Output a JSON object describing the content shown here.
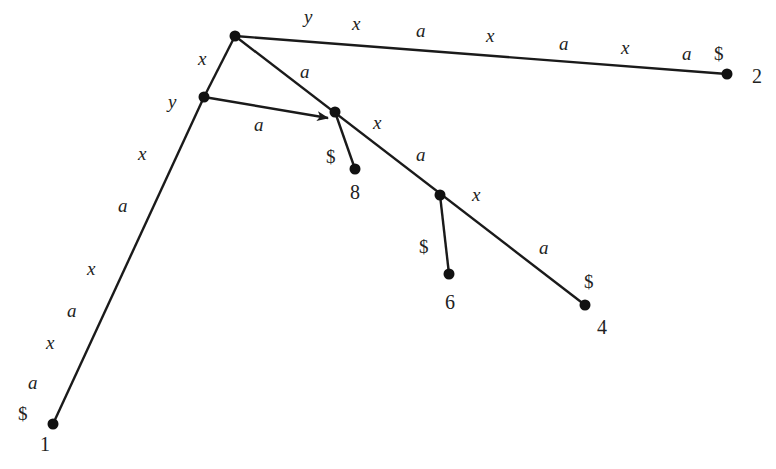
{
  "diagram": {
    "type": "suffix-tree",
    "nodes": {
      "root": {
        "x": 235,
        "y": 36
      },
      "n_x": {
        "x": 204,
        "y": 97
      },
      "n_xa": {
        "x": 335,
        "y": 112
      },
      "n_xaxa": {
        "x": 440,
        "y": 195
      },
      "leaf1": {
        "x": 53,
        "y": 424,
        "label": "1"
      },
      "leaf2": {
        "x": 727,
        "y": 74,
        "label": "2"
      },
      "leaf4": {
        "x": 585,
        "y": 305,
        "label": "4"
      },
      "leaf6": {
        "x": 449,
        "y": 274,
        "label": "6"
      },
      "leaf8": {
        "x": 355,
        "y": 169,
        "label": "8"
      }
    },
    "edge_labels": {
      "root_to_2": [
        "y",
        "x",
        "a",
        "x",
        "a",
        "x",
        "a",
        "$"
      ],
      "root_to_x": [
        "x"
      ],
      "x_to_1": [
        "y",
        "x",
        "a",
        "x",
        "a",
        "x",
        "a",
        "$"
      ],
      "root_to_xa": [
        "a"
      ],
      "suffix_link": [
        "a"
      ],
      "xa_to_8": [
        "$"
      ],
      "xa_to_xaxa": [
        "x",
        "a"
      ],
      "xaxa_to_6": [
        "$"
      ],
      "xaxa_to_4": [
        "x",
        "a",
        "$"
      ]
    }
  },
  "labels": {
    "l2_y": "y",
    "l2_x1": "x",
    "l2_a1": "a",
    "l2_x2": "x",
    "l2_a2": "a",
    "l2_x3": "x",
    "l2_a3": "a",
    "l2_d": "$",
    "lx": "x",
    "ly": "y",
    "l1_x1": "x",
    "l1_a1": "a",
    "l1_x2": "x",
    "l1_a2": "a",
    "l1_x3": "x",
    "l1_a3": "a",
    "l1_d": "$",
    "la_root": "a",
    "la_link": "a",
    "l8_d": "$",
    "lxa_x": "x",
    "lxa_a": "a",
    "l6_d": "$",
    "l4_x": "x",
    "l4_a": "a",
    "l4_d": "$",
    "n1": "1",
    "n2": "2",
    "n4": "4",
    "n6": "6",
    "n8": "8"
  }
}
